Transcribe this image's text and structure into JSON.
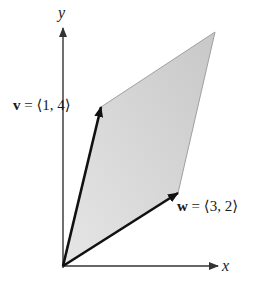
{
  "diagram": {
    "type": "parallelogram spanned by two vectors",
    "axes": {
      "x_label": "x",
      "y_label": "y"
    },
    "vectors": [
      {
        "name": "v",
        "label_prefix": "v",
        "label_rest": " = ⟨1, 4⟩",
        "components": [
          1,
          4
        ]
      },
      {
        "name": "w",
        "label_prefix": "w",
        "label_rest": " = ⟨3, 2⟩",
        "components": [
          3,
          2
        ]
      }
    ],
    "parallelogram": {
      "vertices": [
        [
          0,
          0
        ],
        [
          1,
          4
        ],
        [
          4,
          6
        ],
        [
          3,
          2
        ]
      ],
      "fill": "#d4d4d4"
    },
    "colors": {
      "axis": "#333333",
      "vector": "#111111",
      "fill": "#d4d4d4",
      "edge": "#9a9a9a",
      "background": "#ffffff"
    }
  }
}
